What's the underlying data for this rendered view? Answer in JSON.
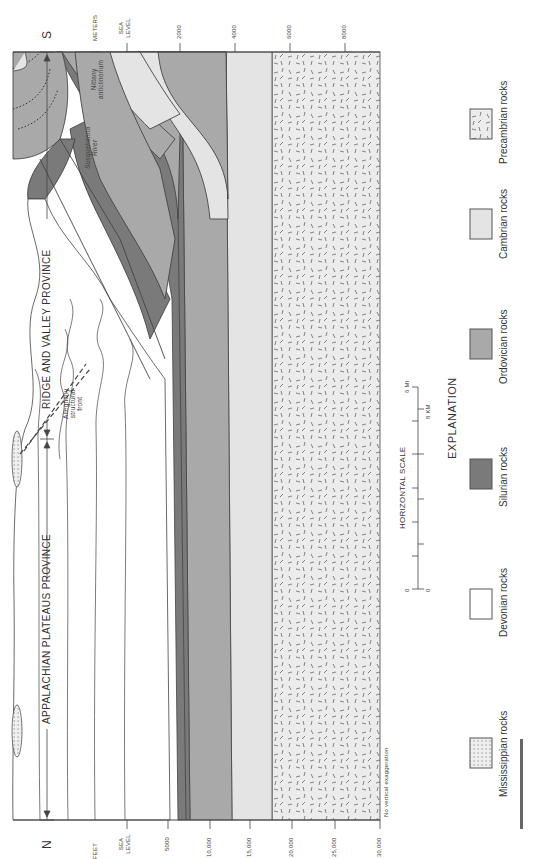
{
  "figure": {
    "orientation": "rotated 90 degrees counter-clockwise",
    "directions": {
      "north": "N",
      "south": "S"
    },
    "provinces": [
      {
        "label": "APPALACHIAN PLATEAUS PROVINCE"
      },
      {
        "label": "RIDGE AND VALLEY PROVINCE"
      }
    ],
    "annotations": {
      "allegheny": "Allegheny structural front",
      "allegheny_lines": [
        "Allegheny",
        "structural",
        "front"
      ],
      "susquehanna_lines": [
        "Susquehanna",
        "River"
      ],
      "nittany_lines": [
        "Nittany",
        "anticlinorium"
      ],
      "no_vertical_exaggeration": "No vertical exaggeration"
    },
    "depth_axis_feet": {
      "unit": "FEET",
      "ticks": [
        "SEA LEVEL",
        "5000",
        "10,000",
        "15,000",
        "20,000",
        "25,000",
        "30,000"
      ]
    },
    "depth_axis_meters": {
      "unit": "METERS",
      "ticks": [
        "SEA LEVEL",
        "2000",
        "4000",
        "6000",
        "8000"
      ]
    },
    "horizontal_scale": {
      "title": "HORIZONTAL SCALE",
      "mi_labels": [
        "0",
        "6 MI"
      ],
      "km_labels": [
        "0",
        "8 KM"
      ]
    },
    "legend": {
      "title": "EXPLANATION",
      "items": [
        {
          "label": "Mississippian rocks",
          "pattern": "dots",
          "color": "#ececec"
        },
        {
          "label": "Devonian rocks",
          "pattern": "none",
          "color": "#ffffff"
        },
        {
          "label": "Silurian rocks",
          "pattern": "none",
          "color": "#7a7a7a"
        },
        {
          "label": "Ordovician rocks",
          "pattern": "none",
          "color": "#a9a9a9"
        },
        {
          "label": "Cambrian rocks",
          "pattern": "none",
          "color": "#e4e4e4"
        },
        {
          "label": "Precambrian rocks",
          "pattern": "dashes",
          "color": "#eeeeee"
        }
      ]
    },
    "colors": {
      "silurian": "#7a7a7a",
      "ordovician": "#a9a9a9",
      "cambrian": "#e4e4e4",
      "precambrian": "#ececec",
      "line": "#444444"
    }
  }
}
